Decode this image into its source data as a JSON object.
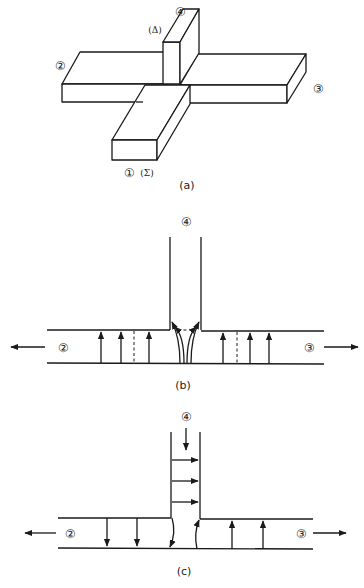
{
  "figure": {
    "panels": [
      {
        "id": "a",
        "caption": "(a)",
        "description": "Isometric sketch of cross-shaped junction with four arms",
        "labels": {
          "port1": "①",
          "port1_symbol": "(Σ)",
          "port2": "②",
          "port3": "③",
          "port4": "④",
          "port4_symbol": "(Δ)"
        }
      },
      {
        "id": "b",
        "caption": "(b)",
        "description": "Field lines for excitation at port 4: outputs at ports 2 and 3 are out of phase",
        "labels": {
          "port2": "②",
          "port3": "③",
          "port4": "④"
        },
        "left_field_arrows": "up",
        "right_field_arrows": "up"
      },
      {
        "id": "c",
        "caption": "(c)",
        "description": "Field lines for excitation at port 4 with transverse field in arm 4",
        "labels": {
          "port2": "②",
          "port3": "③",
          "port4": "④"
        },
        "left_field_arrows": "down",
        "right_field_arrows": "up"
      }
    ],
    "stroke_color": "#1a1a1a",
    "background": "#ffffff"
  }
}
